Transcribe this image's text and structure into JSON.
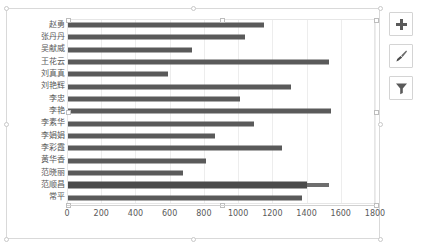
{
  "chart_data": {
    "type": "bar",
    "orientation": "horizontal",
    "title": "",
    "xlabel": "",
    "ylabel": "",
    "xlim": [
      0,
      1800
    ],
    "xticks": [
      0,
      200,
      400,
      600,
      800,
      1000,
      1200,
      1400,
      1600,
      1800
    ],
    "grid": true,
    "legend": "none",
    "bar_color": "#5a5a5a",
    "categories": [
      "赵勇",
      "张丹丹",
      "吴献威",
      "王花云",
      "刘真真",
      "刘艳辉",
      "李忠",
      "李艳",
      "李素华",
      "李娟娟",
      "李彩霞",
      "黄华香",
      "范晓丽",
      "范顺昌",
      "常平"
    ],
    "values": [
      1150,
      1040,
      730,
      1530,
      590,
      1310,
      1010,
      1540,
      1090,
      865,
      1255,
      810,
      680,
      1530,
      1375
    ],
    "series": [
      {
        "name": "系列1",
        "values": [
          1150,
          1040,
          730,
          1530,
          590,
          1310,
          1010,
          1540,
          1090,
          865,
          1255,
          810,
          680,
          1530,
          1375
        ]
      }
    ],
    "highlight_row": {
      "category": "范顺昌",
      "inner_value": 1400,
      "outer_value": 1530
    }
  },
  "axis": {
    "tick_labels": [
      "0",
      "200",
      "400",
      "600",
      "800",
      "1000",
      "1200",
      "1400",
      "1600",
      "1800"
    ]
  },
  "side_buttons": [
    {
      "name": "chart-elements",
      "icon": "plus-icon",
      "label": "+"
    },
    {
      "name": "chart-styles",
      "icon": "brush-icon",
      "label": ""
    },
    {
      "name": "chart-filters",
      "icon": "filter-icon",
      "label": ""
    }
  ],
  "selection": {
    "chart_selected": true,
    "plot_area_selected": true
  }
}
